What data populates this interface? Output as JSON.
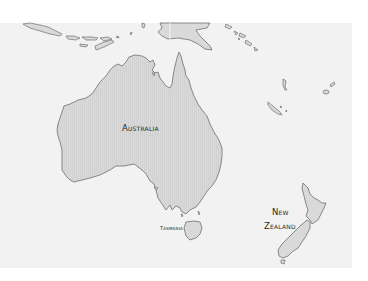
{
  "map": {
    "region": "Australia and Oceania",
    "colors": {
      "page_background": "#ffffff",
      "sea": "#f2f2f2",
      "land": "#d9d9d9",
      "coastline": "#6f6f6f",
      "label": "#2a2a2a"
    },
    "labels": {
      "australia": "Australia",
      "tasmania": "Tasmania",
      "new_zealand_line1": "New",
      "new_zealand_line2": "Zealand"
    }
  }
}
